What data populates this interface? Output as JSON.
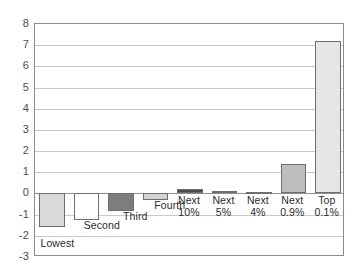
{
  "chart_data": {
    "type": "bar",
    "title": "",
    "subtitle": "",
    "xlabel": "",
    "ylabel": "",
    "ylim": [
      -3,
      8
    ],
    "grid": true,
    "legend": "none",
    "categories": [
      "Lowest",
      "Second",
      "Third",
      "Fourth",
      "Next\n10%",
      "Next\n5%",
      "Next\n4%",
      "Next\n0.9%",
      "Top\n0.1%"
    ],
    "values": [
      -1.6,
      -1.25,
      -0.85,
      -0.3,
      0.2,
      0.12,
      0.08,
      1.4,
      7.2
    ],
    "yticks": [
      8,
      7,
      6,
      5,
      4,
      3,
      2,
      1,
      0,
      -1,
      -2,
      -3
    ],
    "ytick_labels": [
      "8",
      "7",
      "6",
      "5",
      "4",
      "3",
      "2",
      "1",
      "0",
      "-1",
      "-2",
      "-3"
    ],
    "bar_colors": [
      "#d9d9d9",
      "#ffffff",
      "#7d7d7d",
      "#d4d4d4",
      "#4a4a4a",
      "#8a8a8a",
      "#9a9a9a",
      "#bdbdbd",
      "#e6e6e6"
    ],
    "label_placement": [
      "below-left",
      "below",
      "below",
      "below",
      "axis",
      "axis",
      "axis",
      "axis",
      "axis"
    ]
  },
  "colors": {
    "grid": "#c9c9c9",
    "zero_line": "#8f8f8f",
    "frame": "#8c8c8c",
    "bar_outline": "#6e6e6e",
    "axis_text": "#4d4d4d",
    "label_text": "#2b2b2b",
    "background": "#ffffff"
  }
}
